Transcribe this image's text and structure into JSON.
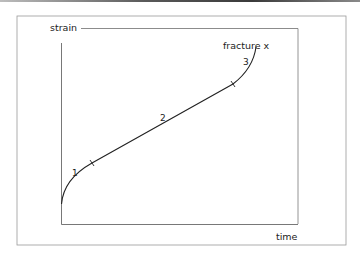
{
  "diagram": {
    "type": "creep-curve",
    "axes": {
      "y_label": "strain",
      "x_label": "time"
    },
    "stages": [
      {
        "label": "1",
        "name": "primary"
      },
      {
        "label": "2",
        "name": "secondary"
      },
      {
        "label": "3",
        "name": "tertiary"
      }
    ],
    "annotation": "fracture x",
    "colors": {
      "line": "#222222",
      "frame": "#8a8a8a",
      "background": "#ffffff"
    }
  }
}
